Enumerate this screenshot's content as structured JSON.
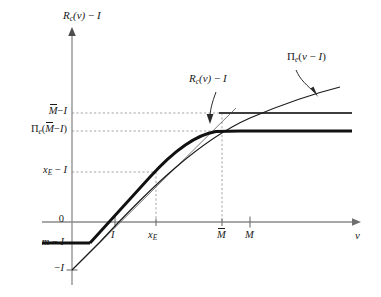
{
  "figure": {
    "type": "diagram",
    "axes": {
      "y_axis_label": "R_c(v) − I",
      "x_axis_label": "v",
      "y_axis_label_parts": {
        "head": "R",
        "head_sub": "c",
        "arg": "(v)",
        "tail": "− I"
      }
    },
    "y_ticks": [
      {
        "id": "mtilde_minus_I",
        "label": "M̃ − I",
        "y": 113,
        "dashed": true
      },
      {
        "id": "pi_mtilde_minus_I",
        "label": "Πe(M̃ − I)",
        "y": 131,
        "dashed": true
      },
      {
        "id": "xE_minus_I",
        "label": "xE − I",
        "y": 172,
        "dashed": true
      },
      {
        "id": "zero",
        "label": "0",
        "y": 222,
        "dashed": false
      },
      {
        "id": "m_minus_I",
        "label": "m − I",
        "y": 243,
        "dashed": false
      },
      {
        "id": "minus_I",
        "label": "−I",
        "y": 270,
        "dashed": false
      }
    ],
    "x_ticks": [
      {
        "id": "I",
        "label": "I",
        "x": 115,
        "dashed": false
      },
      {
        "id": "xE",
        "label": "xE",
        "x": 156,
        "dashed": true
      },
      {
        "id": "Mtilde",
        "label": "M̃",
        "x": 222,
        "dashed": true
      },
      {
        "id": "M",
        "label": "M",
        "x": 250,
        "dashed": false
      }
    ],
    "annotations": [
      {
        "id": "pi-e-curve-label",
        "label": "Πe(v − I)",
        "x": 289,
        "y": 57
      },
      {
        "id": "rc-curve-label",
        "label": "Rc(v) − I",
        "x": 192,
        "y": 79
      }
    ],
    "curves": [
      {
        "id": "rc-curve",
        "name": "R_c(v) - I",
        "style": "thick",
        "color": "#111111"
      },
      {
        "id": "pi-e-curve",
        "name": "Pi_e(v - I)",
        "style": "thin-concave",
        "color": "#111111"
      },
      {
        "id": "tangent-line",
        "name": "45-degree line from -I",
        "style": "thin",
        "color": "#555555"
      },
      {
        "id": "mtilde-level-line",
        "name": "horizontal line at Mtilde - I",
        "style": "medium",
        "color": "#444444"
      }
    ],
    "colors": {
      "ink": "#111111",
      "axis": "#8a8a8a",
      "dash": "#9a9a9a"
    }
  }
}
